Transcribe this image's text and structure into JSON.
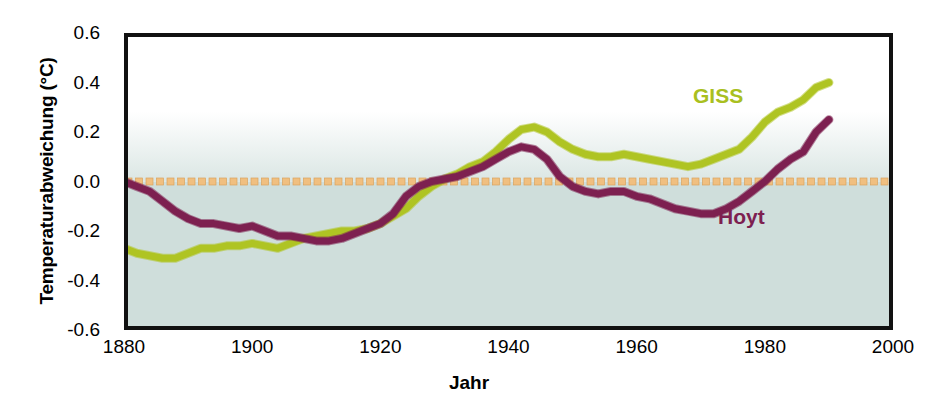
{
  "chart_data": {
    "type": "line",
    "title": "",
    "xlabel": "Jahr",
    "ylabel": "Temperaturabweichung (°C)",
    "xlim": [
      1880,
      2000
    ],
    "ylim": [
      -0.6,
      0.6
    ],
    "xticks": [
      1880,
      1900,
      1920,
      1940,
      1960,
      1980,
      2000
    ],
    "yticks": [
      0.6,
      0.4,
      0.2,
      0.0,
      -0.2,
      -0.4,
      -0.6
    ],
    "ytick_labels": [
      "0.6",
      "0.4",
      "0.2",
      "0.0",
      "-0.2",
      "-0.4",
      "-0.6"
    ],
    "xtick_labels": [
      "1880",
      "1900",
      "1920",
      "1940",
      "1960",
      "1980",
      "2000"
    ],
    "grid": false,
    "legend_position": "inline-annotation",
    "background_below_zero": "#cfdedb",
    "background_above_zero": "#ffffff",
    "reference_line": {
      "name": "zero-line",
      "value": 0.0,
      "style": "dotted-squares",
      "color": "#f0bf80"
    },
    "series": [
      {
        "name": "GISS",
        "color": "#afc423",
        "label_text": "GISS",
        "x": [
          1880,
          1882,
          1884,
          1886,
          1888,
          1890,
          1892,
          1894,
          1896,
          1898,
          1900,
          1902,
          1904,
          1906,
          1908,
          1910,
          1912,
          1914,
          1916,
          1918,
          1920,
          1922,
          1924,
          1926,
          1928,
          1930,
          1932,
          1934,
          1936,
          1938,
          1940,
          1942,
          1944,
          1946,
          1948,
          1950,
          1952,
          1954,
          1956,
          1958,
          1960,
          1962,
          1964,
          1966,
          1968,
          1970,
          1972,
          1974,
          1976,
          1978,
          1980,
          1982,
          1984,
          1986,
          1988,
          1990
        ],
        "values": [
          -0.27,
          -0.29,
          -0.3,
          -0.31,
          -0.31,
          -0.29,
          -0.27,
          -0.27,
          -0.26,
          -0.26,
          -0.25,
          -0.26,
          -0.27,
          -0.25,
          -0.23,
          -0.22,
          -0.21,
          -0.2,
          -0.2,
          -0.19,
          -0.17,
          -0.14,
          -0.11,
          -0.06,
          -0.02,
          0.01,
          0.03,
          0.06,
          0.08,
          0.12,
          0.17,
          0.21,
          0.22,
          0.2,
          0.16,
          0.13,
          0.11,
          0.1,
          0.1,
          0.11,
          0.1,
          0.09,
          0.08,
          0.07,
          0.06,
          0.07,
          0.09,
          0.11,
          0.13,
          0.18,
          0.24,
          0.28,
          0.3,
          0.33,
          0.38,
          0.4
        ]
      },
      {
        "name": "Hoyt",
        "color": "#7d2050",
        "label_text": "Hoyt",
        "x": [
          1880,
          1882,
          1884,
          1886,
          1888,
          1890,
          1892,
          1894,
          1896,
          1898,
          1900,
          1902,
          1904,
          1906,
          1908,
          1910,
          1912,
          1914,
          1916,
          1918,
          1920,
          1922,
          1924,
          1926,
          1928,
          1930,
          1932,
          1934,
          1936,
          1938,
          1940,
          1942,
          1944,
          1946,
          1948,
          1950,
          1952,
          1954,
          1956,
          1958,
          1960,
          1962,
          1964,
          1966,
          1968,
          1970,
          1972,
          1974,
          1976,
          1978,
          1980,
          1982,
          1984,
          1986,
          1988,
          1990
        ],
        "values": [
          0.0,
          -0.02,
          -0.04,
          -0.08,
          -0.12,
          -0.15,
          -0.17,
          -0.17,
          -0.18,
          -0.19,
          -0.18,
          -0.2,
          -0.22,
          -0.22,
          -0.23,
          -0.24,
          -0.24,
          -0.23,
          -0.21,
          -0.19,
          -0.17,
          -0.13,
          -0.06,
          -0.02,
          0.0,
          0.01,
          0.02,
          0.04,
          0.06,
          0.09,
          0.12,
          0.14,
          0.13,
          0.09,
          0.02,
          -0.02,
          -0.04,
          -0.05,
          -0.04,
          -0.04,
          -0.06,
          -0.07,
          -0.09,
          -0.11,
          -0.12,
          -0.13,
          -0.13,
          -0.11,
          -0.08,
          -0.04,
          0.0,
          0.05,
          0.09,
          0.12,
          0.2,
          0.25
        ]
      }
    ]
  },
  "annotations": {
    "giss_label": "GISS",
    "hoyt_label": "Hoyt"
  },
  "axis": {
    "y_title": "Temperaturabweichung (°C)",
    "x_title": "Jahr"
  }
}
